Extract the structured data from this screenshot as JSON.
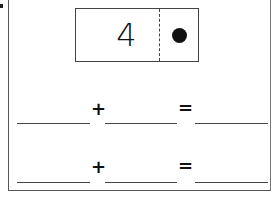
{
  "worksheet": {
    "domino": {
      "left_value": "4",
      "right_pips": 1
    },
    "equations": [
      {
        "plus": "+",
        "equals": "="
      },
      {
        "plus": "+",
        "equals": "="
      }
    ]
  }
}
